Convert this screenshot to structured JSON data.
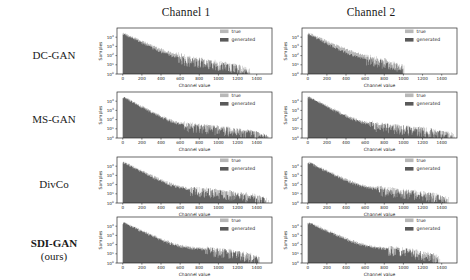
{
  "figure": {
    "background": "#ffffff",
    "column_titles": [
      "Channel 1",
      "Channel 2"
    ],
    "row_labels": [
      {
        "text": "DC-GAN",
        "bold": false
      },
      {
        "text": "MS-GAN",
        "bold": false
      },
      {
        "text": "DivCo",
        "bold": false
      },
      {
        "text": "SDI-GAN",
        "bold": true,
        "second_line": "(ours)"
      }
    ]
  },
  "chart_data": {
    "type": "bar",
    "title": "",
    "panel_grid": {
      "rows": 4,
      "cols": 2
    },
    "xlabel": "Channel value",
    "ylabel": "Samples",
    "xlim": [
      -60,
      1560
    ],
    "ylim_log": [
      1,
      100000
    ],
    "xticks": [
      0,
      200,
      400,
      600,
      800,
      1000,
      1200,
      1400
    ],
    "xtick_labels": [
      "0",
      "200",
      "400",
      "600",
      "800",
      "1000",
      "1200",
      "1400"
    ],
    "yticks": [
      1,
      10,
      100,
      1000,
      10000
    ],
    "ytick_labels": [
      "10",
      "10",
      "10",
      "10",
      "10"
    ],
    "ytick_exponents": [
      "0",
      "1",
      "2",
      "3",
      "4"
    ],
    "yscale": "log",
    "grid": false,
    "legend": {
      "position": "upper right",
      "entries": [
        {
          "name": "true",
          "color": "#b8b8b8"
        },
        {
          "name": "generated",
          "color": "#5a5a5a"
        }
      ]
    },
    "colors": {
      "true": "#b8b8b8",
      "generated": "#5a5a5a",
      "frame": "#2a2a2a"
    },
    "panels": [
      {
        "row": 0,
        "col": 0,
        "model": "DC-GAN",
        "channel": "Channel 1",
        "true_profile": {
          "peak": 30000,
          "head_decay": 600,
          "body_level": 60,
          "tail_start": 560,
          "tail_level": 18,
          "cutoff": 1330
        },
        "generated_profile": {
          "peak": 25000,
          "head_decay": 520,
          "body_level": 55,
          "tail_start": 560,
          "tail_level": 6,
          "cutoff": 1300
        }
      },
      {
        "row": 0,
        "col": 1,
        "model": "DC-GAN",
        "channel": "Channel 2",
        "true_profile": {
          "peak": 30000,
          "head_decay": 600,
          "body_level": 70,
          "tail_start": 600,
          "tail_level": 25,
          "cutoff": 1010
        },
        "generated_profile": {
          "peak": 24000,
          "head_decay": 500,
          "body_level": 60,
          "tail_start": 600,
          "tail_level": 9,
          "cutoff": 990
        }
      },
      {
        "row": 1,
        "col": 0,
        "model": "MS-GAN",
        "channel": "Channel 1",
        "true_profile": {
          "peak": 32000,
          "head_decay": 500,
          "body_level": 40,
          "tail_start": 620,
          "tail_level": 5,
          "cutoff": 1520
        },
        "generated_profile": {
          "peak": 30000,
          "head_decay": 470,
          "body_level": 36,
          "tail_start": 620,
          "tail_level": 4,
          "cutoff": 1510
        }
      },
      {
        "row": 1,
        "col": 1,
        "model": "MS-GAN",
        "channel": "Channel 2",
        "true_profile": {
          "peak": 33000,
          "head_decay": 520,
          "body_level": 45,
          "tail_start": 640,
          "tail_level": 5,
          "cutoff": 1530
        },
        "generated_profile": {
          "peak": 30000,
          "head_decay": 490,
          "body_level": 40,
          "tail_start": 640,
          "tail_level": 4,
          "cutoff": 1520
        }
      },
      {
        "row": 2,
        "col": 0,
        "model": "DivCo",
        "channel": "Channel 1",
        "true_profile": {
          "peak": 31000,
          "head_decay": 540,
          "body_level": 50,
          "tail_start": 700,
          "tail_level": 4,
          "cutoff": 1520
        },
        "generated_profile": {
          "peak": 28000,
          "head_decay": 500,
          "body_level": 45,
          "tail_start": 700,
          "tail_level": 3,
          "cutoff": 1500
        }
      },
      {
        "row": 2,
        "col": 1,
        "model": "DivCo",
        "channel": "Channel 2",
        "true_profile": {
          "peak": 30000,
          "head_decay": 560,
          "body_level": 55,
          "tail_start": 720,
          "tail_level": 4,
          "cutoff": 1480
        },
        "generated_profile": {
          "peak": 27000,
          "head_decay": 520,
          "body_level": 48,
          "tail_start": 720,
          "tail_level": 3,
          "cutoff": 1460
        }
      },
      {
        "row": 3,
        "col": 0,
        "model": "SDI-GAN (ours)",
        "channel": "Channel 1",
        "true_profile": {
          "peak": 29000,
          "head_decay": 580,
          "body_level": 60,
          "tail_start": 860,
          "tail_level": 3,
          "cutoff": 1430
        },
        "generated_profile": {
          "peak": 26000,
          "head_decay": 540,
          "body_level": 52,
          "tail_start": 860,
          "tail_level": 2,
          "cutoff": 1410
        }
      },
      {
        "row": 3,
        "col": 1,
        "model": "SDI-GAN (ours)",
        "channel": "Channel 2",
        "true_profile": {
          "peak": 29000,
          "head_decay": 600,
          "body_level": 62,
          "tail_start": 840,
          "tail_level": 3,
          "cutoff": 1380
        },
        "generated_profile": {
          "peak": 26000,
          "head_decay": 560,
          "body_level": 55,
          "tail_start": 840,
          "tail_level": 2,
          "cutoff": 1360
        }
      }
    ]
  }
}
